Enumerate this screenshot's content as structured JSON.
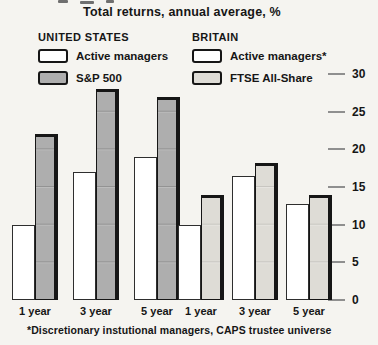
{
  "title": "Total returns, annual average, %",
  "footnote": "*Discretionary instutional managers, CAPS trustee universe",
  "colors": {
    "background": "#f5f4f0",
    "ink": "#161616",
    "bar_active": "#ffffff",
    "bar_sp500": "#aeaeae",
    "bar_ftse": "#dedcd6",
    "tick": "#8f8f8f"
  },
  "legend": {
    "united_states": {
      "heading": "UNITED STATES",
      "items": [
        {
          "label": "Active managers",
          "swatch": "active"
        },
        {
          "label": "S&P 500",
          "swatch": "sp500"
        }
      ]
    },
    "britain": {
      "heading": "BRITAIN",
      "items": [
        {
          "label": "Active managers*",
          "swatch": "active"
        },
        {
          "label": "FTSE All-Share",
          "swatch": "ftse"
        }
      ]
    }
  },
  "chart_data": {
    "type": "bar",
    "title": "Total returns, annual average, %",
    "xlabel": "",
    "ylabel": "%",
    "ylim": [
      0,
      30
    ],
    "yticks": [
      0,
      5,
      10,
      15,
      20,
      25,
      30
    ],
    "axis_side": "right",
    "grid": false,
    "legend_position": "top",
    "groups": [
      {
        "region": "UNITED STATES",
        "categories": [
          "1 year",
          "3 year",
          "5 year"
        ],
        "series": [
          {
            "name": "Active managers",
            "values": [
              10,
              17,
              19
            ]
          },
          {
            "name": "S&P 500",
            "values": [
              22,
              28,
              27
            ]
          }
        ]
      },
      {
        "region": "BRITAIN",
        "categories": [
          "1 year",
          "3 year",
          "5 year"
        ],
        "series": [
          {
            "name": "Active managers*",
            "values": [
              10,
              16.5,
              12.7
            ]
          },
          {
            "name": "FTSE All-Share",
            "values": [
              14,
              18.2,
              14
            ]
          }
        ]
      }
    ]
  }
}
